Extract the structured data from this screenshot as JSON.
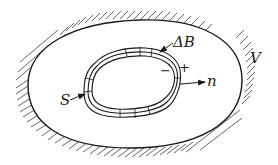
{
  "diagram": {
    "type": "physics-region-diagram",
    "labels": {
      "outer_region": "V",
      "inner_surface": "S",
      "boundary_layer": "ΔB",
      "normal": "n",
      "minus_side": "−",
      "plus_side": "+"
    },
    "colors": {
      "stroke": "#1a1a1a",
      "hatch": "#555555",
      "background": "#ffffff"
    }
  }
}
